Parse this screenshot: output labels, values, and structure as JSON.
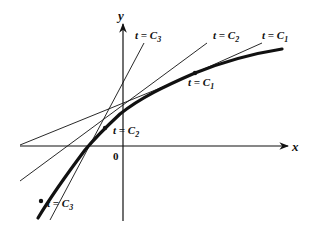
{
  "diagram": {
    "axes": {
      "x_label": "x",
      "y_label": "y",
      "origin_label": "0"
    },
    "curve": {
      "description": "solution curve of an ODE, concave, increasing",
      "points": [
        [
          38,
          218
        ],
        [
          62,
          180
        ],
        [
          85,
          148
        ],
        [
          105,
          128
        ],
        [
          125,
          110
        ],
        [
          165,
          90
        ],
        [
          195,
          73
        ],
        [
          240,
          58
        ],
        [
          280,
          50
        ]
      ]
    },
    "tangent_points": [
      {
        "name": "C1",
        "label": "t = C",
        "subscript": "1",
        "x": 195,
        "y": 73
      },
      {
        "name": "C2",
        "label": "t = C",
        "subscript": "2",
        "x": 105,
        "y": 128
      },
      {
        "name": "C3",
        "label": "t = C",
        "subscript": "3",
        "x": 41,
        "y": 201
      }
    ],
    "tangent_lines": [
      {
        "name": "C1",
        "label": "t = C",
        "subscript": "1"
      },
      {
        "name": "C2",
        "label": "t = C",
        "subscript": "2"
      },
      {
        "name": "C3",
        "label": "t = C",
        "subscript": "3"
      }
    ],
    "colors": {
      "stroke": "#111111",
      "background": "#ffffff"
    }
  }
}
